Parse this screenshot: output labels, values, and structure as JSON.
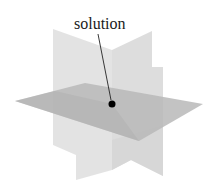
{
  "diagram": {
    "label": "solution",
    "elements": [
      {
        "name": "vertical-plane-left",
        "color": "#dcdcdc"
      },
      {
        "name": "vertical-plane-right",
        "color": "#d6d6d6"
      },
      {
        "name": "horizontal-plane",
        "color": "#b9b9b9"
      },
      {
        "name": "solution-point",
        "color": "#000000"
      }
    ]
  }
}
